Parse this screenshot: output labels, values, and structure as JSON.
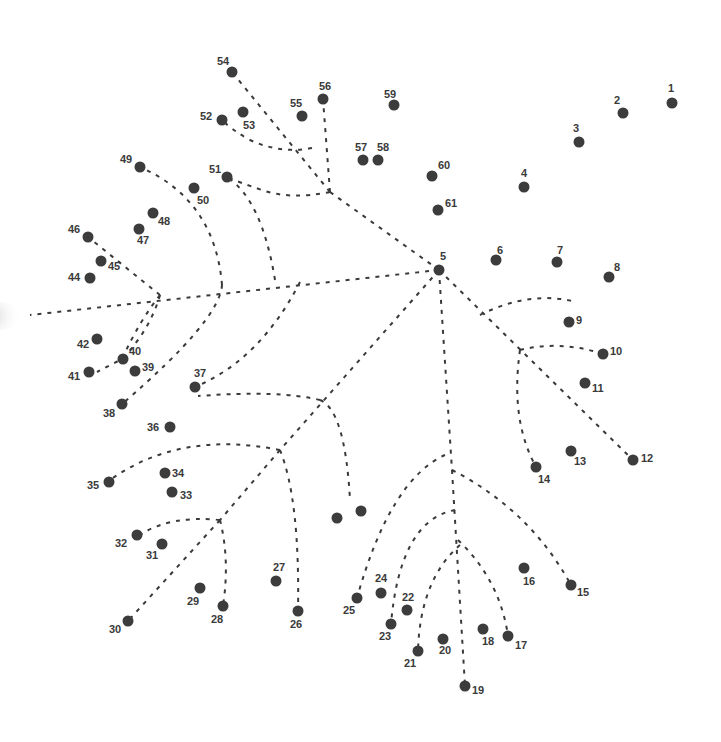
{
  "puzzle": {
    "type": "connect-the-dots",
    "dot_color": "#3c3c3c",
    "line_color": "#3a3a3a",
    "background": "#ffffff",
    "dots": [
      {
        "n": "1",
        "x": 672,
        "y": 103,
        "lx": 668,
        "ly": 92
      },
      {
        "n": "2",
        "x": 623,
        "y": 113,
        "lx": 614,
        "ly": 104
      },
      {
        "n": "3",
        "x": 579,
        "y": 142,
        "lx": 573,
        "ly": 132
      },
      {
        "n": "4",
        "x": 524,
        "y": 187,
        "lx": 521,
        "ly": 177
      },
      {
        "n": "5",
        "x": 439,
        "y": 270,
        "lx": 440,
        "ly": 260
      },
      {
        "n": "6",
        "x": 496,
        "y": 260,
        "lx": 497,
        "ly": 254
      },
      {
        "n": "7",
        "x": 557,
        "y": 262,
        "lx": 557,
        "ly": 254
      },
      {
        "n": "8",
        "x": 609,
        "y": 277,
        "lx": 614,
        "ly": 271
      },
      {
        "n": "9",
        "x": 569,
        "y": 322,
        "lx": 576,
        "ly": 324
      },
      {
        "n": "10",
        "x": 603,
        "y": 354,
        "lx": 610,
        "ly": 355
      },
      {
        "n": "11",
        "x": 585,
        "y": 383,
        "lx": 592,
        "ly": 392
      },
      {
        "n": "12",
        "x": 633,
        "y": 460,
        "lx": 641,
        "ly": 462
      },
      {
        "n": "13",
        "x": 571,
        "y": 451,
        "lx": 574,
        "ly": 465
      },
      {
        "n": "14",
        "x": 536,
        "y": 467,
        "lx": 538,
        "ly": 483
      },
      {
        "n": "15",
        "x": 571,
        "y": 585,
        "lx": 577,
        "ly": 596
      },
      {
        "n": "16",
        "x": 524,
        "y": 568,
        "lx": 523,
        "ly": 585
      },
      {
        "n": "17",
        "x": 508,
        "y": 636,
        "lx": 515,
        "ly": 649
      },
      {
        "n": "18",
        "x": 483,
        "y": 629,
        "lx": 482,
        "ly": 645
      },
      {
        "n": "19",
        "x": 465,
        "y": 686,
        "lx": 472,
        "ly": 694
      },
      {
        "n": "20",
        "x": 443,
        "y": 639,
        "lx": 439,
        "ly": 654
      },
      {
        "n": "21",
        "x": 418,
        "y": 651,
        "lx": 404,
        "ly": 667
      },
      {
        "n": "22",
        "x": 407,
        "y": 610,
        "lx": 402,
        "ly": 601
      },
      {
        "n": "23",
        "x": 391,
        "y": 624,
        "lx": 379,
        "ly": 640
      },
      {
        "n": "24",
        "x": 381,
        "y": 593,
        "lx": 375,
        "ly": 582
      },
      {
        "n": "25",
        "x": 357,
        "y": 598,
        "lx": 343,
        "ly": 614
      },
      {
        "n": "26",
        "x": 298,
        "y": 611,
        "lx": 290,
        "ly": 628
      },
      {
        "n": "27",
        "x": 276,
        "y": 581,
        "lx": 273,
        "ly": 571
      },
      {
        "n": "28",
        "x": 223,
        "y": 606,
        "lx": 211,
        "ly": 623
      },
      {
        "n": "29",
        "x": 200,
        "y": 588,
        "lx": 187,
        "ly": 605
      },
      {
        "n": "30",
        "x": 128,
        "y": 621,
        "lx": 109,
        "ly": 633
      },
      {
        "n": "31",
        "x": 162,
        "y": 544,
        "lx": 146,
        "ly": 559
      },
      {
        "n": "32",
        "x": 137,
        "y": 535,
        "lx": 115,
        "ly": 547
      },
      {
        "n": "33",
        "x": 172,
        "y": 492,
        "lx": 180,
        "ly": 499
      },
      {
        "n": "34",
        "x": 165,
        "y": 473,
        "lx": 172,
        "ly": 477
      },
      {
        "n": "35",
        "x": 109,
        "y": 482,
        "lx": 87,
        "ly": 489
      },
      {
        "n": "36",
        "x": 170,
        "y": 427,
        "lx": 147,
        "ly": 431
      },
      {
        "n": "37",
        "x": 195,
        "y": 387,
        "lx": 194,
        "ly": 377
      },
      {
        "n": "38",
        "x": 122,
        "y": 404,
        "lx": 103,
        "ly": 417
      },
      {
        "n": "39",
        "x": 135,
        "y": 371,
        "lx": 142,
        "ly": 371
      },
      {
        "n": "40",
        "x": 123,
        "y": 359,
        "lx": 129,
        "ly": 355
      },
      {
        "n": "41",
        "x": 89,
        "y": 372,
        "lx": 68,
        "ly": 380
      },
      {
        "n": "42",
        "x": 97,
        "y": 339,
        "lx": 77,
        "ly": 348
      },
      {
        "n": "44",
        "x": 90,
        "y": 278,
        "lx": 68,
        "ly": 281
      },
      {
        "n": "45",
        "x": 101,
        "y": 261,
        "lx": 108,
        "ly": 270
      },
      {
        "n": "46",
        "x": 88,
        "y": 237,
        "lx": 68,
        "ly": 233
      },
      {
        "n": "47",
        "x": 139,
        "y": 229,
        "lx": 137,
        "ly": 244
      },
      {
        "n": "48",
        "x": 153,
        "y": 213,
        "lx": 158,
        "ly": 225
      },
      {
        "n": "49",
        "x": 140,
        "y": 167,
        "lx": 120,
        "ly": 163
      },
      {
        "n": "50",
        "x": 194,
        "y": 188,
        "lx": 197,
        "ly": 204
      },
      {
        "n": "51",
        "x": 227,
        "y": 177,
        "lx": 209,
        "ly": 173
      },
      {
        "n": "52",
        "x": 222,
        "y": 120,
        "lx": 200,
        "ly": 120
      },
      {
        "n": "53",
        "x": 243,
        "y": 112,
        "lx": 243,
        "ly": 129
      },
      {
        "n": "54",
        "x": 232,
        "y": 72,
        "lx": 217,
        "ly": 65
      },
      {
        "n": "55",
        "x": 302,
        "y": 116,
        "lx": 290,
        "ly": 107
      },
      {
        "n": "56",
        "x": 323,
        "y": 99,
        "lx": 319,
        "ly": 90
      },
      {
        "n": "57",
        "x": 363,
        "y": 160,
        "lx": 355,
        "ly": 151
      },
      {
        "n": "58",
        "x": 378,
        "y": 160,
        "lx": 377,
        "ly": 151
      },
      {
        "n": "59",
        "x": 394,
        "y": 105,
        "lx": 384,
        "ly": 98
      },
      {
        "n": "60",
        "x": 432,
        "y": 176,
        "lx": 438,
        "ly": 169
      },
      {
        "n": "61",
        "x": 438,
        "y": 210,
        "lx": 445,
        "ly": 207
      },
      {
        "n": "",
        "x": 337,
        "y": 518,
        "lx": 0,
        "ly": 0
      },
      {
        "n": "",
        "x": 361,
        "y": 511,
        "lx": 0,
        "ly": 0
      }
    ],
    "branches": [
      "M439,270 L330,192",
      "M330,192 L232,72",
      "M330,192 L323,99",
      "M312,148 Q280,154 250,140 Q232,130 222,120",
      "M330,192 Q290,200 262,190 Q238,182 227,177",
      "M439,270 L30,315",
      "M160,295 L88,237",
      "M160,295 Q140,320 122,359",
      "M160,295 Q150,330 122,359 L97,372",
      "M222,285 Q215,200 140,167",
      "M222,285 Q220,320 122,404",
      "M275,280 Q262,200 227,177",
      "M300,282 Q260,360 195,387",
      "M439,270 L280,450",
      "M320,400 Q345,410 350,500",
      "M320,400 Q280,390 198,396",
      "M280,450 Q180,430 110,480",
      "M280,450 Q300,500 298,611",
      "M280,450 L220,520",
      "M220,520 Q170,515 140,535",
      "M220,520 Q230,560 223,606",
      "M220,520 L128,621",
      "M439,270 L452,470",
      "M452,470 L465,686",
      "M452,470 Q530,510 571,585",
      "M445,455 Q390,480 357,598",
      "M455,510 Q400,520 391,624",
      "M460,545 Q420,580 418,651",
      "M458,540 Q500,580 508,636",
      "M439,270 L633,460",
      "M480,315 Q530,290 576,302",
      "M520,350 Q560,340 603,354",
      "M520,350 Q510,420 536,467"
    ]
  }
}
